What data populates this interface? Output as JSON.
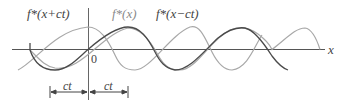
{
  "figure": {
    "labels": {
      "wave_left": "f*(x+ct)",
      "wave_center": "f*(x)",
      "wave_right": "f*(x−ct)",
      "x_axis": "x",
      "origin": "0",
      "dim_left": "ct",
      "dim_right": "ct"
    },
    "colors": {
      "dark_curve": "#4a4a4a",
      "light_curve": "#a8a8a8",
      "axis": "#555555"
    }
  }
}
